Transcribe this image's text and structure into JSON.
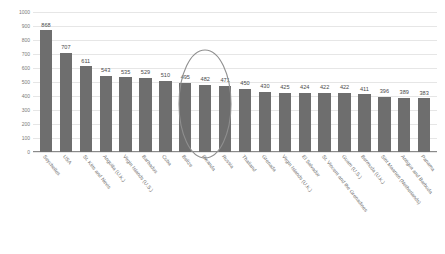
{
  "chart_data": {
    "type": "bar",
    "title": "",
    "subtitle": "",
    "xlabel": "",
    "ylabel": "Number of prisoners per 100 000 population",
    "ylim": [
      0,
      1000
    ],
    "yticks": [
      0,
      100,
      200,
      300,
      400,
      500,
      600,
      700,
      800,
      900,
      1000
    ],
    "grid": true,
    "legend": false,
    "bar_color": "#6e6e6e",
    "categories": [
      "Seychelles",
      "USA",
      "St. Kitts and Nevis",
      "Anguilla (U.K.)",
      "Virgin Islands (U.S.)",
      "Barbados",
      "Cuba",
      "Belize",
      "Rwanda",
      "Russia",
      "Thailand",
      "Grenada",
      "Virgin Islands (U.K.)",
      "El Salvador",
      "St. Vincent and the Grenadines",
      "Guam (U.S.)",
      "Bermuda (U.K.)",
      "Sint Maarten (Netherlands)",
      "Antigua and Barbuda",
      "Panama"
    ],
    "values": [
      868,
      707,
      611,
      543,
      535,
      529,
      510,
      495,
      482,
      471,
      450,
      430,
      425,
      424,
      422,
      422,
      411,
      396,
      389,
      383
    ],
    "annotations": [
      {
        "type": "ellipse",
        "label": "highlight-ellipse",
        "encircles": [
          "Rwanda",
          "Russia",
          "Thailand"
        ]
      }
    ]
  }
}
